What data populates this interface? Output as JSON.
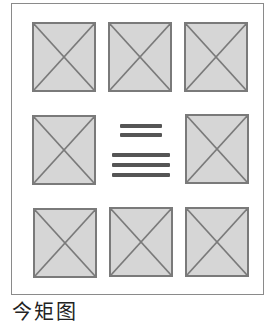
{
  "diagram": {
    "type": "grid-layout-wireframe",
    "rows": 3,
    "columns": 3,
    "cells": [
      {
        "row": 0,
        "col": 0,
        "kind": "image-placeholder"
      },
      {
        "row": 0,
        "col": 1,
        "kind": "image-placeholder"
      },
      {
        "row": 0,
        "col": 2,
        "kind": "image-placeholder"
      },
      {
        "row": 1,
        "col": 0,
        "kind": "image-placeholder"
      },
      {
        "row": 1,
        "col": 1,
        "kind": "text-lines",
        "lines": [
          {
            "group": "heading",
            "count": 2
          },
          {
            "group": "body",
            "count": 3
          }
        ]
      },
      {
        "row": 1,
        "col": 2,
        "kind": "image-placeholder"
      },
      {
        "row": 2,
        "col": 0,
        "kind": "image-placeholder"
      },
      {
        "row": 2,
        "col": 1,
        "kind": "image-placeholder"
      },
      {
        "row": 2,
        "col": 2,
        "kind": "image-placeholder"
      }
    ],
    "colors": {
      "placeholder_fill": "#d6d6d6",
      "placeholder_stroke": "#7a7a7a",
      "text_line": "#555555",
      "frame": "#8a8a8a"
    }
  },
  "caption": "今矩图"
}
